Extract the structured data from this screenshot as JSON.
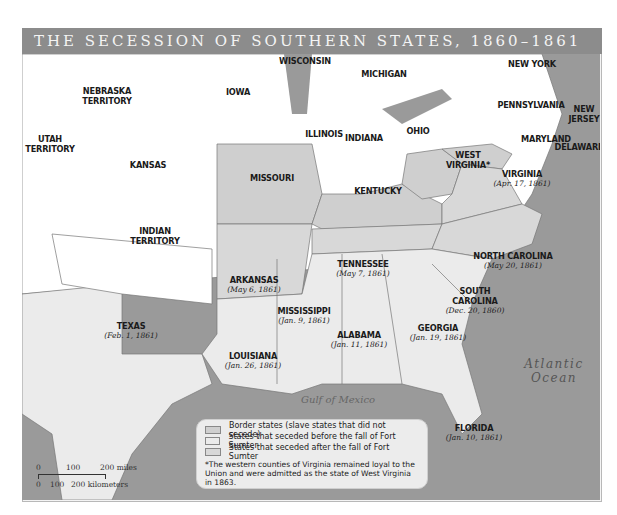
{
  "title": "THE SECESSION OF SOUTHERN STATES, 1860–1861",
  "states": {
    "nebraska": "NEBRASKA",
    "nebraska2": "TERRITORY",
    "iowa": "IOWA",
    "wisconsin": "WISCONSIN",
    "michigan": "MICHIGAN",
    "new_york": "NEW YORK",
    "utah": "UTAH",
    "utah2": "TERRITORY",
    "kansas": "KANSAS",
    "illinois": "ILLINOIS",
    "indiana": "INDIANA",
    "ohio": "OHIO",
    "pennsylvania": "PENNSYLVANIA",
    "new_jersey": "NEW",
    "new_jersey2": "JERSEY",
    "maryland": "MARYLAND",
    "delaware": "DELAWARE",
    "missouri": "MISSOURI",
    "west_virginia": "WEST",
    "west_virginia2": "VIRGINIA*",
    "kentucky": "KENTUCKY",
    "virginia": "VIRGINIA",
    "virginia_date": "(Apr. 17, 1861)",
    "indian": "INDIAN",
    "indian2": "TERRITORY",
    "arkansas": "ARKANSAS",
    "arkansas_date": "(May 6, 1861)",
    "tennessee": "TENNESSEE",
    "tennessee_date": "(May 7, 1861)",
    "north_carolina": "NORTH CAROLINA",
    "north_carolina_date": "(May 20, 1861)",
    "south_carolina": "SOUTH",
    "south_carolina2": "CAROLINA",
    "south_carolina_date": "(Dec. 20, 1860)",
    "mississippi": "MISSISSIPPI",
    "mississippi_date": "(Jan. 9, 1861)",
    "alabama": "ALABAMA",
    "alabama_date": "(Jan. 11, 1861)",
    "georgia": "GEORGIA",
    "georgia_date": "(Jan. 19, 1861)",
    "texas": "TEXAS",
    "texas_date": "(Feb. 1, 1861)",
    "louisiana": "LOUISIANA",
    "louisiana_date": "(Jan. 26, 1861)",
    "florida": "FLORIDA",
    "florida_date": "(Jan. 10, 1861)"
  },
  "water": {
    "atlantic": "Atlantic",
    "ocean": "Ocean",
    "gulf": "Gulf of Mexico"
  },
  "legend": {
    "items": [
      {
        "label": "Border states (slave states that did not secede)",
        "color": "#c4c4c4"
      },
      {
        "label": "States that seceded before the fall of Fort Sumter",
        "color": "#e3e3e3"
      },
      {
        "label": "States that seceded after the fall of Fort Sumter",
        "color": "#d2d2d2"
      }
    ],
    "note": "*The western counties of Virginia remained loyal to the Union and were admitted as the state of West Virginia in 1863."
  },
  "scale": {
    "miles": [
      "0",
      "100",
      "200 miles"
    ],
    "km": [
      "0",
      "100",
      "200 kilometers"
    ]
  },
  "colors": {
    "union": "#ffffff",
    "border": "#cfcfcf",
    "before_sumter": "#ebebeb",
    "after_sumter": "#d8d8d8",
    "water": "#8e8e8e",
    "title_bar": "#8c8c8c"
  }
}
